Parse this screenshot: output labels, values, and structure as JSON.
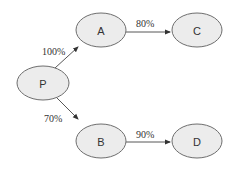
{
  "diagram": {
    "nodes": [
      {
        "id": "P",
        "label": "P"
      },
      {
        "id": "A",
        "label": "A"
      },
      {
        "id": "B",
        "label": "B"
      },
      {
        "id": "C",
        "label": "C"
      },
      {
        "id": "D",
        "label": "D"
      }
    ],
    "edges": [
      {
        "from": "P",
        "to": "A",
        "label": "100%"
      },
      {
        "from": "P",
        "to": "B",
        "label": "70%"
      },
      {
        "from": "A",
        "to": "C",
        "label": "80%"
      },
      {
        "from": "B",
        "to": "D",
        "label": "90%"
      }
    ]
  }
}
